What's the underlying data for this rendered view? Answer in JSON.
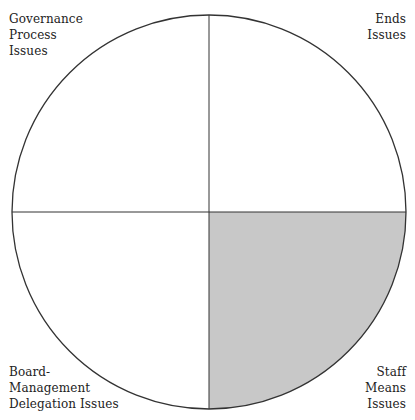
{
  "diagram": {
    "type": "quadrant-circle",
    "center": [
      209,
      212
    ],
    "radius": 197,
    "colors": {
      "stroke": "#333333",
      "shaded_fill": "#c8c8c8",
      "background": "#ffffff"
    },
    "shaded_quadrant": "bottom-right",
    "quadrants": {
      "top_left": {
        "lines": [
          "Governance",
          "Process",
          "Issues"
        ]
      },
      "top_right": {
        "lines": [
          "Ends",
          "Issues"
        ]
      },
      "bottom_left": {
        "lines": [
          "Board-",
          "Management",
          "Delegation Issues"
        ]
      },
      "bottom_right": {
        "lines": [
          "Staff",
          "Means",
          "Issues"
        ]
      }
    }
  }
}
